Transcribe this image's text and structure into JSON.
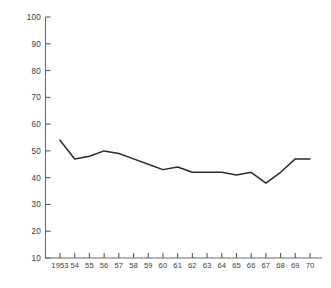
{
  "chart_data": {
    "type": "line",
    "title": "",
    "subtitle": "",
    "xlabel": "",
    "ylabel": "",
    "grid": false,
    "legend": null,
    "legend_position": "none",
    "xlim": [
      1953,
      1970
    ],
    "ylim": [
      10,
      100
    ],
    "y_tick_step": 10,
    "y_ticks": [
      10,
      20,
      30,
      40,
      50,
      60,
      70,
      80,
      90,
      100
    ],
    "y_tick_labels": [
      "10",
      "20",
      "30",
      "40",
      "50",
      "60",
      "70",
      "80",
      "90",
      "100"
    ],
    "x": [
      1953,
      1954,
      1955,
      1956,
      1957,
      1958,
      1959,
      1960,
      1961,
      1962,
      1963,
      1964,
      1965,
      1966,
      1967,
      1968,
      1969,
      1970
    ],
    "x_tick_labels": [
      "1953",
      "54",
      "55",
      "56",
      "57",
      "58",
      "59",
      "60",
      "61",
      "62",
      "63",
      "64",
      "65",
      "66",
      "67",
      "68",
      "69",
      "70"
    ],
    "series": [
      {
        "name": "series-1",
        "color": "#2b2b2b",
        "values": [
          54,
          47,
          48,
          50,
          49,
          47,
          45,
          43,
          44,
          42,
          42,
          42,
          41,
          42,
          38,
          42,
          47,
          47
        ]
      }
    ],
    "axis_color": "#6b6b6b",
    "tick_color": "#555555",
    "label_color": "#3a3a3a",
    "background": "#ffffff"
  }
}
